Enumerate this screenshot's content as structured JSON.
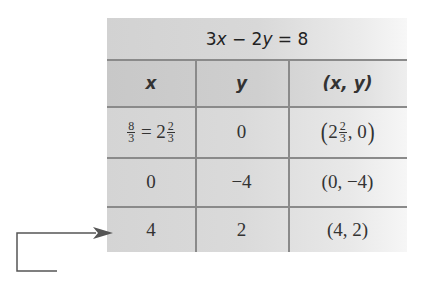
{
  "table": {
    "title": {
      "coef_x": "3",
      "var_x": "x",
      "op": " − 2",
      "var_y": "y",
      "rhs": " = 8"
    },
    "columns": [
      {
        "label": "x"
      },
      {
        "label": "y"
      },
      {
        "label": "(x, y)"
      }
    ],
    "rows": [
      {
        "x": {
          "frac_num": "8",
          "frac_den": "3",
          "eq": " = 2",
          "mixed_num": "2",
          "mixed_den": "3"
        },
        "y": "0",
        "point": {
          "open": "(",
          "whole": "2",
          "frac_num": "2",
          "frac_den": "3",
          "rest": ", 0",
          "close": ")"
        }
      },
      {
        "x": "0",
        "y": "−4",
        "point": "(0, −4)"
      },
      {
        "x": "4",
        "y": "2",
        "point": "(4, 2)"
      }
    ]
  },
  "annotation": {
    "arrow_target_row": 3,
    "arrow_color": "#555555"
  }
}
